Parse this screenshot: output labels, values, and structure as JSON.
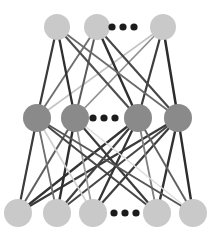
{
  "figure": {
    "background_color": "#ffffff",
    "width": 211,
    "height": 234
  },
  "chart_data": {
    "type": "diagram",
    "diagram_kind": "neural-network-graph",
    "title": "",
    "layers": [
      {
        "name": "top-layer",
        "role": "output-layer",
        "y": 27,
        "node_color": "#c9c9c9",
        "node_radius": 13,
        "node_count_visible": 3,
        "nodes": [
          {
            "id": "t1",
            "x": 57,
            "y": 27,
            "label": ""
          },
          {
            "id": "t2",
            "x": 97,
            "y": 27,
            "label": ""
          },
          {
            "id": "t3",
            "x": 163,
            "y": 27,
            "label": ""
          }
        ],
        "ellipsis": {
          "x": 123,
          "y": 27,
          "dots": 3,
          "dot_radius": 3.6,
          "dot_gap": 11,
          "color": "#1c1c1c"
        }
      },
      {
        "name": "middle-layer",
        "role": "hidden-layer",
        "y": 118,
        "node_color": "#8a8a8a",
        "node_radius": 14,
        "node_count_visible": 4,
        "nodes": [
          {
            "id": "m1",
            "x": 37,
            "y": 118,
            "label": ""
          },
          {
            "id": "m2",
            "x": 75,
            "y": 118,
            "label": ""
          },
          {
            "id": "m3",
            "x": 138,
            "y": 118,
            "label": ""
          },
          {
            "id": "m4",
            "x": 178,
            "y": 118,
            "label": ""
          }
        ],
        "ellipsis": {
          "x": 104,
          "y": 118,
          "dots": 3,
          "dot_radius": 3.6,
          "dot_gap": 11,
          "color": "#1c1c1c"
        }
      },
      {
        "name": "bottom-layer",
        "role": "input-layer",
        "y": 213,
        "node_color": "#c9c9c9",
        "node_radius": 14,
        "node_count_visible": 5,
        "nodes": [
          {
            "id": "b1",
            "x": 18,
            "y": 213,
            "label": ""
          },
          {
            "id": "b2",
            "x": 57,
            "y": 213,
            "label": ""
          },
          {
            "id": "b3",
            "x": 93,
            "y": 213,
            "label": ""
          },
          {
            "id": "b4",
            "x": 157,
            "y": 213,
            "label": ""
          },
          {
            "id": "b5",
            "x": 193,
            "y": 213,
            "label": ""
          }
        ],
        "ellipsis": {
          "x": 125,
          "y": 213,
          "dots": 3,
          "dot_radius": 3.6,
          "dot_gap": 11,
          "color": "#1c1c1c"
        }
      }
    ],
    "edge_style": {
      "description": "Every node of each layer is connected to every node of the adjacent layer; stroke darkness encodes weight magnitude.",
      "width_range": [
        1.4,
        2.6
      ],
      "colors": [
        "#2e2e2e",
        "#4a4a4a",
        "#6b6b6b",
        "#8f8f8f",
        "#b3b3b3",
        "#d2d2d2"
      ]
    },
    "edges": [
      {
        "from": "m1",
        "to": "t1",
        "color": "#3a3a3a",
        "width": 2.2
      },
      {
        "from": "m1",
        "to": "t2",
        "color": "#6f6f6f",
        "width": 1.9
      },
      {
        "from": "m1",
        "to": "t3",
        "color": "#c4c4c4",
        "width": 1.6
      },
      {
        "from": "m2",
        "to": "t1",
        "color": "#2f2f2f",
        "width": 2.3
      },
      {
        "from": "m2",
        "to": "t2",
        "color": "#5a5a5a",
        "width": 2.0
      },
      {
        "from": "m2",
        "to": "t3",
        "color": "#8e8e8e",
        "width": 1.7
      },
      {
        "from": "m3",
        "to": "t1",
        "color": "#4e4e4e",
        "width": 2.1
      },
      {
        "from": "m3",
        "to": "t2",
        "color": "#303030",
        "width": 2.4
      },
      {
        "from": "m3",
        "to": "t3",
        "color": "#3c3c3c",
        "width": 2.2
      },
      {
        "from": "m4",
        "to": "t1",
        "color": "#6a6a6a",
        "width": 1.8
      },
      {
        "from": "m4",
        "to": "t2",
        "color": "#474747",
        "width": 2.1
      },
      {
        "from": "m4",
        "to": "t3",
        "color": "#2c2c2c",
        "width": 2.5
      },
      {
        "from": "b1",
        "to": "m1",
        "color": "#3b3b3b",
        "width": 2.2
      },
      {
        "from": "b1",
        "to": "m2",
        "color": "#5d5d5d",
        "width": 2.0
      },
      {
        "from": "b1",
        "to": "m3",
        "color": "#333333",
        "width": 2.3
      },
      {
        "from": "b1",
        "to": "m4",
        "color": "#3a3a3a",
        "width": 2.2
      },
      {
        "from": "b2",
        "to": "m1",
        "color": "#6e6e6e",
        "width": 1.8
      },
      {
        "from": "b2",
        "to": "m2",
        "color": "#2e2e2e",
        "width": 2.4
      },
      {
        "from": "b2",
        "to": "m3",
        "color": "#3f3f3f",
        "width": 2.2
      },
      {
        "from": "b2",
        "to": "m4",
        "color": "#454545",
        "width": 2.1
      },
      {
        "from": "b3",
        "to": "m1",
        "color": "#cfcfcf",
        "width": 1.6
      },
      {
        "from": "b3",
        "to": "m2",
        "color": "#9b9b9b",
        "width": 1.7
      },
      {
        "from": "b3",
        "to": "m3",
        "color": "#343434",
        "width": 2.3
      },
      {
        "from": "b3",
        "to": "m4",
        "color": "#3d3d3d",
        "width": 2.2
      },
      {
        "from": "b4",
        "to": "m1",
        "color": "#464646",
        "width": 2.1
      },
      {
        "from": "b4",
        "to": "m2",
        "color": "#3a3a3a",
        "width": 2.2
      },
      {
        "from": "b4",
        "to": "m3",
        "color": "#808080",
        "width": 1.8
      },
      {
        "from": "b4",
        "to": "m4",
        "color": "#323232",
        "width": 2.4
      },
      {
        "from": "b5",
        "to": "m1",
        "color": "#555555",
        "width": 2.0
      },
      {
        "from": "b5",
        "to": "m2",
        "color": "#dcdcdc",
        "width": 1.5
      },
      {
        "from": "b5",
        "to": "m3",
        "color": "#606060",
        "width": 1.9
      },
      {
        "from": "b5",
        "to": "m4",
        "color": "#2d2d2d",
        "width": 2.4
      }
    ]
  }
}
